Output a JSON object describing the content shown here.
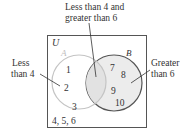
{
  "diagram": {
    "type": "venn",
    "universe_label": "U",
    "sets": [
      {
        "name": "A",
        "label": "A",
        "elements": [
          "1",
          "2",
          "3"
        ]
      },
      {
        "name": "B",
        "label": "B",
        "elements": [
          "7",
          "8",
          "9",
          "10"
        ]
      }
    ],
    "intersection": [],
    "outside": "4, 5, 6",
    "callouts": {
      "top_line1": "Less than 4 and",
      "top_line2": "greater than 6",
      "left_line1": "Less",
      "left_line2": "than 4",
      "right_line1": "Greater",
      "right_line2": "than 6"
    },
    "colors": {
      "circle_a_stroke": "#c8c8c8",
      "circle_b_stroke": "#555555",
      "circle_b_fill": "#ececec",
      "intersection_fill": "#e4e4e4",
      "box_stroke": "#555555",
      "text": "#333333"
    }
  }
}
